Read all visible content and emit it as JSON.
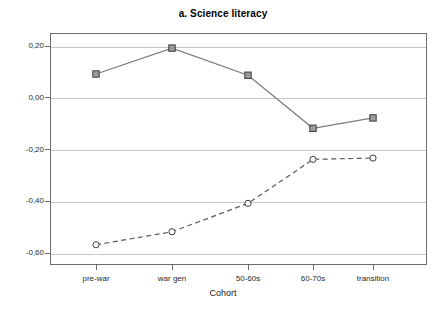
{
  "chart_data": {
    "type": "line",
    "title": "a. Science literacy",
    "xlabel": "Cohort",
    "ylabel": "",
    "categories": [
      "pre-war",
      "war gen",
      "50-60s",
      "60-70s",
      "transition"
    ],
    "ylim": [
      -0.68,
      0.29
    ],
    "yticks": [
      0.2,
      0.0,
      -0.2,
      -0.4,
      -0.6
    ],
    "ytick_labels": [
      "0,20",
      "0,00",
      "-0,20",
      "-0,40",
      "-0,60"
    ],
    "grid": true,
    "legend": "none",
    "series": [
      {
        "name": "solid-square-series",
        "marker": "square",
        "linestyle": "solid",
        "color": "#7a7a7a",
        "values": [
          0.09,
          0.19,
          0.085,
          -0.12,
          -0.08
        ]
      },
      {
        "name": "dashed-circle-series",
        "marker": "circle",
        "linestyle": "dashed",
        "color": "#5a5a5a",
        "values": [
          -0.57,
          -0.52,
          -0.41,
          -0.24,
          -0.235
        ]
      }
    ]
  },
  "colors": {
    "frame": "#6e6e6e",
    "grid": "#c8c8c8",
    "background": "#ffffff",
    "text": "#1a1a1a"
  }
}
